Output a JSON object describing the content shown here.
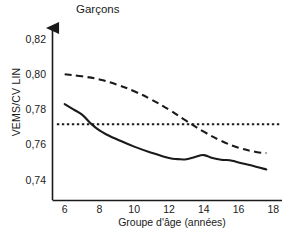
{
  "chart_data": {
    "type": "line",
    "title": "Garçons",
    "xlabel": "Groupe d'âge (années)",
    "ylabel": "VEMS/CV LIN",
    "xlim": [
      5.3,
      18.5
    ],
    "ylim": [
      0.7335,
      0.8245
    ],
    "grid": false,
    "legend_position": "none",
    "xticks": [
      "6",
      "8",
      "10",
      "12",
      "14",
      "16",
      "18"
    ],
    "xtick_values": [
      6,
      8,
      10,
      12,
      14,
      16,
      18
    ],
    "yticks": [
      "0,82",
      "0,80",
      "0,78",
      "0,76",
      "0,74"
    ],
    "ytick_values": [
      0.82,
      0.8,
      0.78,
      0.76,
      0.74
    ],
    "series": [
      {
        "name": "dashed-upper-curve",
        "style": "dashed",
        "color": "#1a1a1a",
        "x": [
          6,
          7,
          8,
          9,
          10,
          11,
          12,
          13,
          14,
          15,
          16,
          17,
          17.6
        ],
        "values": [
          0.8005,
          0.7993,
          0.7975,
          0.7946,
          0.7908,
          0.786,
          0.7803,
          0.7739,
          0.7678,
          0.7626,
          0.7587,
          0.7563,
          0.7556
        ]
      },
      {
        "name": "solid-lower-curve",
        "style": "solid",
        "color": "#1a1a1a",
        "x": [
          6,
          6.5,
          7,
          7.5,
          8,
          8.5,
          9,
          10,
          11,
          12,
          12.5,
          13,
          13.5,
          14,
          14.5,
          15,
          15.5,
          16,
          17,
          17.6
        ],
        "values": [
          0.7835,
          0.7805,
          0.7775,
          0.7725,
          0.7685,
          0.7658,
          0.7635,
          0.7593,
          0.7558,
          0.7528,
          0.7522,
          0.7521,
          0.7534,
          0.7545,
          0.7528,
          0.7518,
          0.7516,
          0.7503,
          0.7479,
          0.7463
        ]
      },
      {
        "name": "dotted-reference-line",
        "style": "dotted",
        "color": "#1a1a1a",
        "x": [
          5.55,
          18.4
        ],
        "values": [
          0.772,
          0.772
        ]
      }
    ],
    "axis_color": "#1a1a1a",
    "text_color": "#1a1a1a"
  }
}
